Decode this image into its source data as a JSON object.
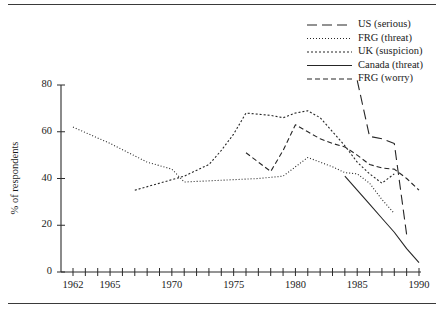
{
  "figure": {
    "top_rule": true,
    "bottom_rule": true
  },
  "axes": {
    "y_axis_label": "% of respondents",
    "y_ticks": [
      "0",
      "20",
      "40",
      "60",
      "80"
    ],
    "x_ticks_labeled": [
      "1962",
      "1965",
      "1970",
      "1975",
      "1980",
      "1985",
      "1990"
    ]
  },
  "legend": {
    "position": "top-right",
    "entries": [
      {
        "label": "US (serious)",
        "dash": "10,5"
      },
      {
        "label": "FRG (threat)",
        "dash": "1,2"
      },
      {
        "label": "UK (suspicion)",
        "dash": "2,2"
      },
      {
        "label": "Canada (threat)",
        "dash": "none"
      },
      {
        "label": "FRG (worry)",
        "dash": "5,3"
      }
    ]
  },
  "chart_data": {
    "type": "line",
    "title": "",
    "xlabel": "",
    "ylabel": "% of respondents",
    "xlim": [
      1962,
      1990
    ],
    "ylim": [
      0,
      80
    ],
    "grid": false,
    "legend_position": "top-right",
    "x_tick_interval": 1,
    "x_tick_labels": [
      1962,
      1965,
      1970,
      1975,
      1980,
      1985,
      1990
    ],
    "y_tick_labels": [
      0,
      20,
      40,
      60,
      80
    ],
    "series": [
      {
        "name": "US (serious)",
        "dash": "10,5",
        "x": [
          1985,
          1986,
          1987,
          1988,
          1989
        ],
        "values": [
          82,
          58,
          57,
          55,
          16
        ]
      },
      {
        "name": "FRG (threat)",
        "dash": "1,2",
        "x": [
          1962,
          1965,
          1968,
          1970,
          1971,
          1973,
          1975,
          1977,
          1979,
          1980,
          1981,
          1982,
          1983,
          1984,
          1985,
          1986,
          1987,
          1988
        ],
        "values": [
          62,
          55,
          47,
          44,
          38.5,
          39,
          39.5,
          40,
          41,
          45,
          49,
          47,
          45,
          42.5,
          42,
          38,
          31,
          25
        ]
      },
      {
        "name": "UK (suspicion)",
        "dash": "2,2",
        "x": [
          1967,
          1969,
          1971,
          1973,
          1974,
          1975,
          1976,
          1977,
          1978,
          1979,
          1980,
          1981,
          1982,
          1983,
          1984,
          1985,
          1986,
          1987,
          1988
        ],
        "values": [
          35,
          38,
          41,
          46,
          52,
          59,
          68,
          67.5,
          67,
          66,
          68,
          69,
          66,
          60,
          54,
          47,
          42,
          38,
          42
        ]
      },
      {
        "name": "Canada (threat)",
        "dash": "none",
        "x": [
          1984,
          1985,
          1986,
          1987,
          1988,
          1989,
          1990
        ],
        "values": [
          41,
          35,
          29,
          23,
          17,
          10,
          4
        ]
      },
      {
        "name": "FRG (worry)",
        "dash": "5,3",
        "x": [
          1976,
          1977,
          1978,
          1979,
          1980,
          1981,
          1982,
          1983,
          1984,
          1985,
          1986,
          1987,
          1988,
          1989,
          1990
        ],
        "values": [
          51,
          47,
          43,
          52,
          63,
          60,
          57,
          55,
          53.5,
          50,
          46,
          44.5,
          44,
          40,
          35
        ]
      }
    ]
  }
}
